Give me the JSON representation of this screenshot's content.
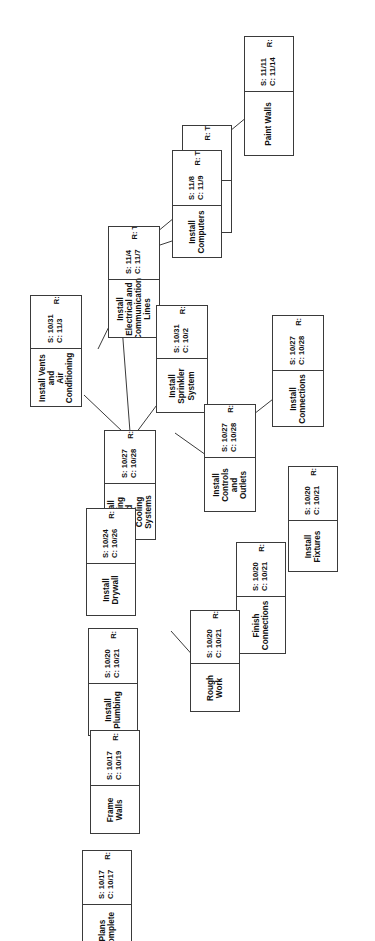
{
  "diagram": {
    "orientation": "text-rotated-90",
    "labels": {
      "start_prefix": "S:",
      "complete_prefix": "C:",
      "resource_prefix": "R:"
    },
    "nodes": [
      {
        "id": "plans-complete",
        "name": "Plans Complete",
        "start": "S: 10/17",
        "complete": "C: 10/17",
        "resource": "R: WK"
      },
      {
        "id": "frame-walls",
        "name": "Frame Walls",
        "start": "S: 10/17",
        "complete": "C: 10/19",
        "resource": "R: WK"
      },
      {
        "id": "install-plumbing",
        "name": "Install Plumbing",
        "start": "S: 10/20",
        "complete": "C: 10/21",
        "resource": "R: WK"
      },
      {
        "id": "rough-work",
        "name": "Rough Work",
        "start": "S: 10/20",
        "complete": "C: 10/21",
        "resource": "R: WK"
      },
      {
        "id": "finish-connections",
        "name": "Finish Connections",
        "start": "S: 10/20",
        "complete": "C: 10/21",
        "resource": "R: WK"
      },
      {
        "id": "install-fixtures",
        "name": "Install Fixtures",
        "start": "S: 10/20",
        "complete": "C: 10/21",
        "resource": "R: WK"
      },
      {
        "id": "install-drywall",
        "name": "Install Drywall",
        "start": "S: 10/24",
        "complete": "C: 10/26",
        "resource": "R: WK"
      },
      {
        "id": "install-heating-and-cooling-systems",
        "name": "Install Heating and\nCooling Systems",
        "start": "S: 10/27",
        "complete": "C: 10/28",
        "resource": "R: JH"
      },
      {
        "id": "install-controls-and-outlets",
        "name": "Install Controls\nand Outlets",
        "start": "S: 10/27",
        "complete": "C: 10/28",
        "resource": "R: JH"
      },
      {
        "id": "install-connections",
        "name": "Install Connections",
        "start": "S: 10/27",
        "complete": "C: 10/28",
        "resource": "R: JH"
      },
      {
        "id": "install-sprinkler-system",
        "name": "Install Sprinkler\nSystem",
        "start": "S: 10/31",
        "complete": "C: 10/2",
        "resource": "R: GT"
      },
      {
        "id": "install-vents-and-air-conditioning",
        "name": "Install Vents and\nAir Conditioning",
        "start": "S: 10/31",
        "complete": "C: 11/3",
        "resource": "R: JH"
      },
      {
        "id": "install-electrical-and-communication-lines",
        "name": "Install Electrical and\nCommunication\nLines",
        "start": "S: 11/4",
        "complete": "C: 11/7",
        "resource": "R: TB"
      },
      {
        "id": "install-phones",
        "name": "Install Phones",
        "start": "S: 11/8",
        "complete": "C: 11/9",
        "resource": "R: TB"
      },
      {
        "id": "install-computers",
        "name": "Install Computers",
        "start": "S: 11/8",
        "complete": "C: 11/9",
        "resource": "R: TB"
      },
      {
        "id": "paint-walls",
        "name": "Paint Walls",
        "start": "S: 11/11",
        "complete": "C: 11/14",
        "resource": "R: CS"
      }
    ]
  }
}
